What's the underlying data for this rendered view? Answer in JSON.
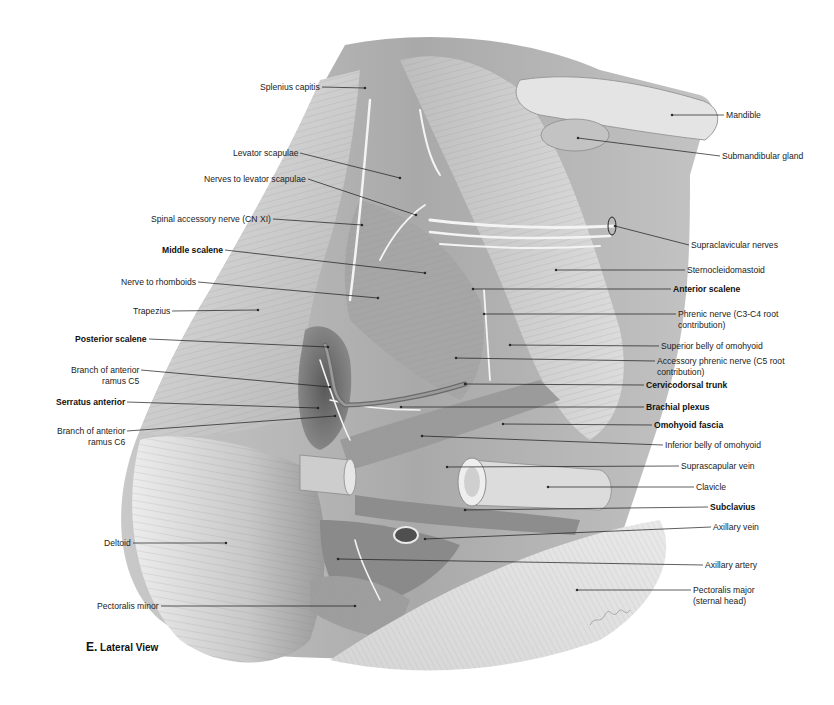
{
  "figure": {
    "caption_letter": "E.",
    "caption_text": " Lateral View",
    "artist_signature": "signature"
  },
  "labels_left": [
    {
      "id": "splenius-capitis",
      "text": "Splenius capitis",
      "bold": false,
      "x": 246,
      "y": 82,
      "tx": 365,
      "ty": 88
    },
    {
      "id": "levator-scapulae",
      "text": "Levator scapulae",
      "bold": false,
      "x": 224,
      "y": 148,
      "tx": 400,
      "ty": 178
    },
    {
      "id": "nerves-to-levator-scapulae",
      "text": "Nerves to levator scapulae",
      "bold": false,
      "x": 186,
      "y": 174,
      "tx": 416,
      "ty": 215
    },
    {
      "id": "spinal-accessory-nerve",
      "text": "Spinal accessory nerve (CN XI)",
      "bold": false,
      "x": 133,
      "y": 214,
      "tx": 362,
      "ty": 225
    },
    {
      "id": "middle-scalene",
      "text": "Middle scalene",
      "bold": true,
      "x": 159,
      "y": 245,
      "tx": 425,
      "ty": 273
    },
    {
      "id": "nerve-to-rhomboids",
      "text": "Nerve to rhomboids",
      "bold": false,
      "x": 113,
      "y": 277,
      "tx": 378,
      "ty": 298
    },
    {
      "id": "trapezius",
      "text": "Trapezius",
      "bold": false,
      "x": 129,
      "y": 306,
      "tx": 258,
      "ty": 310
    },
    {
      "id": "posterior-scalene",
      "text": "Posterior scalene",
      "bold": true,
      "x": 69,
      "y": 334,
      "tx": 328,
      "ty": 347
    },
    {
      "id": "branch-anterior-ramus-c5",
      "text": "Branch of anterior\nramus C5",
      "bold": false,
      "x": 56,
      "y": 365,
      "tx": 330,
      "ty": 387
    },
    {
      "id": "serratus-anterior",
      "text": "Serratus anterior",
      "bold": true,
      "x": 47,
      "y": 397,
      "tx": 318,
      "ty": 408
    },
    {
      "id": "branch-anterior-ramus-c6",
      "text": "Branch of anterior\nramus C6",
      "bold": false,
      "x": 42,
      "y": 426,
      "tx": 335,
      "ty": 416
    },
    {
      "id": "deltoid",
      "text": "Deltoid",
      "bold": false,
      "x": 99,
      "y": 538,
      "tx": 226,
      "ty": 543
    },
    {
      "id": "pectoralis-minor",
      "text": "Pectoralis minor",
      "bold": false,
      "x": 85,
      "y": 601,
      "tx": 355,
      "ty": 606
    }
  ],
  "labels_right": [
    {
      "id": "mandible",
      "text": "Mandible",
      "bold": false,
      "x": 726,
      "y": 110,
      "tx": 672,
      "ty": 115
    },
    {
      "id": "submandibular-gland",
      "text": "Submandibular gland",
      "bold": false,
      "x": 722,
      "y": 151,
      "tx": 578,
      "ty": 138
    },
    {
      "id": "supraclavicular-nerves",
      "text": "Supraclavicular nerves",
      "bold": false,
      "x": 691,
      "y": 240,
      "tx": 615,
      "ty": 226
    },
    {
      "id": "sternocleidomastoid",
      "text": "Sternocleidomastoid",
      "bold": false,
      "x": 687,
      "y": 265,
      "tx": 556,
      "ty": 270
    },
    {
      "id": "anterior-scalene",
      "text": "Anterior scalene",
      "bold": true,
      "x": 673,
      "y": 284,
      "tx": 473,
      "ty": 289
    },
    {
      "id": "phrenic-nerve",
      "text": "Phrenic nerve (C3-C4 root\ncontribution)",
      "bold": false,
      "x": 678,
      "y": 309,
      "tx": 484,
      "ty": 314
    },
    {
      "id": "superior-belly-omohyoid",
      "text": "Superior belly of omohyoid",
      "bold": false,
      "x": 661,
      "y": 341,
      "tx": 510,
      "ty": 345
    },
    {
      "id": "accessory-phrenic-nerve",
      "text": "Accessory phrenic nerve (C5 root\ncontribution)",
      "bold": false,
      "x": 657,
      "y": 356,
      "tx": 456,
      "ty": 358
    },
    {
      "id": "cervicodorsal-trunk",
      "text": "Cervicodorsal trunk",
      "bold": true,
      "x": 646,
      "y": 380,
      "tx": 465,
      "ty": 384
    },
    {
      "id": "brachial-plexus",
      "text": "Brachial plexus",
      "bold": true,
      "x": 646,
      "y": 402,
      "tx": 401,
      "ty": 407
    },
    {
      "id": "omohyoid-fascia",
      "text": "Omohyoid fascia",
      "bold": true,
      "x": 654,
      "y": 420,
      "tx": 503,
      "ty": 424
    },
    {
      "id": "inferior-belly-omohyoid",
      "text": "Inferior belly of omohyoid",
      "bold": false,
      "x": 665,
      "y": 440,
      "tx": 422,
      "ty": 436
    },
    {
      "id": "suprascapular-vein",
      "text": "Suprascapular vein",
      "bold": false,
      "x": 681,
      "y": 461,
      "tx": 447,
      "ty": 467
    },
    {
      "id": "clavicle",
      "text": "Clavicle",
      "bold": false,
      "x": 696,
      "y": 482,
      "tx": 548,
      "ty": 487
    },
    {
      "id": "subclavius",
      "text": "Subclavius",
      "bold": true,
      "x": 710,
      "y": 502,
      "tx": 465,
      "ty": 510
    },
    {
      "id": "axillary-vein",
      "text": "Axillary vein",
      "bold": false,
      "x": 713,
      "y": 522,
      "tx": 425,
      "ty": 539
    },
    {
      "id": "axillary-artery",
      "text": "Axillary artery",
      "bold": false,
      "x": 705,
      "y": 560,
      "tx": 338,
      "ty": 559
    },
    {
      "id": "pectoralis-major",
      "text": "Pectoralis major\n(sternal head)",
      "bold": false,
      "x": 693,
      "y": 585,
      "tx": 577,
      "ty": 590
    }
  ],
  "colors": {
    "background": "#ffffff",
    "muscle_light": "#d9d9d9",
    "muscle_mid": "#b5b5b5",
    "muscle_dark": "#7d7d7d",
    "cavity": "#4a4a4a",
    "nerve": "#f2f2f2",
    "leader_line": "#1a1a1a",
    "label_text": "#222222"
  }
}
